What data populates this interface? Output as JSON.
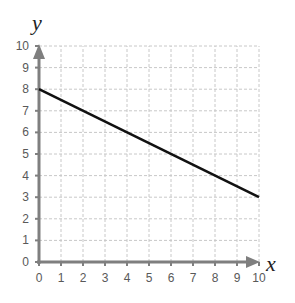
{
  "chart_data": {
    "type": "line",
    "title": "",
    "xlabel": "x",
    "ylabel": "y",
    "xlim": [
      0,
      10
    ],
    "ylim": [
      0,
      10
    ],
    "x_ticks": [
      "0",
      "1",
      "2",
      "3",
      "4",
      "5",
      "6",
      "7",
      "8",
      "9",
      "10"
    ],
    "y_ticks": [
      "0",
      "1",
      "2",
      "3",
      "4",
      "5",
      "6",
      "7",
      "8",
      "9",
      "10"
    ],
    "grid": true,
    "legend": null,
    "series": [
      {
        "name": "line",
        "x": [
          0,
          10
        ],
        "y": [
          8,
          3
        ],
        "color": "#111111"
      }
    ],
    "equation_implied": "y = -0.5x + 8"
  },
  "colors": {
    "axis": "#7f7f7f",
    "grid": "#c8c8c8",
    "line": "#111111",
    "tick_text": "#595959"
  }
}
